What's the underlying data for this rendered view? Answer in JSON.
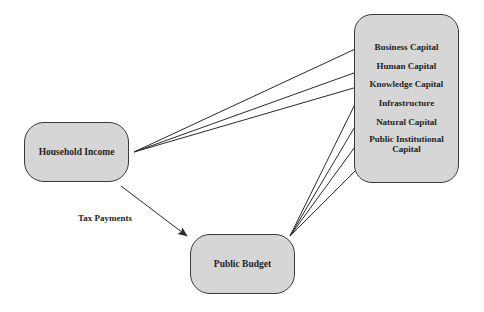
{
  "nodes": {
    "household_income": "Household Income",
    "public_budget": "Public Budget",
    "capitals": [
      "Business Capital",
      "Human Capital",
      "Knowledge Capital",
      "Infrastructure",
      "Natural Capital",
      "Public Institutional Capital"
    ]
  },
  "edges": {
    "tax_label": "Tax Payments",
    "household_to": [
      "Business Capital",
      "Human Capital",
      "Knowledge Capital"
    ],
    "budget_to": [
      "Knowledge Capital",
      "Infrastructure",
      "Natural Capital",
      "Public Institutional Capital"
    ]
  },
  "colors": {
    "box_fill": "#d6d6d6",
    "stroke": "#3a3a3a"
  }
}
